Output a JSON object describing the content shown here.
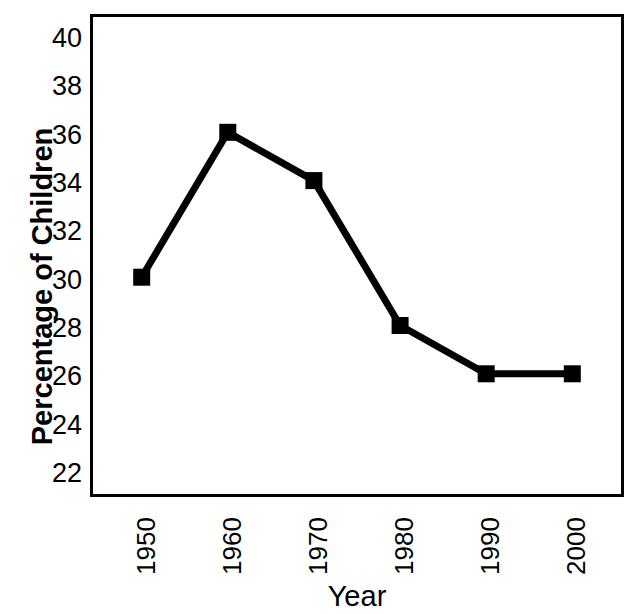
{
  "chart_data": {
    "type": "line",
    "title": "",
    "xlabel": "Year",
    "ylabel": "Percentage of Children",
    "categories": [
      "1950",
      "1960",
      "1970",
      "1980",
      "1990",
      "2000"
    ],
    "x": [
      1950,
      1960,
      1970,
      1980,
      1990,
      2000
    ],
    "values": [
      30.1,
      36.1,
      34.1,
      28.1,
      26.1,
      26.1
    ],
    "series": [
      {
        "name": "Percentage of Children",
        "values": [
          30.1,
          36.1,
          34.1,
          28.1,
          26.1,
          26.1
        ]
      }
    ],
    "ylim": [
      21,
      41
    ],
    "xlim": [
      1944,
      2006
    ],
    "yticks": [
      22,
      24,
      26,
      28,
      30,
      32,
      34,
      36,
      38,
      40
    ],
    "ytick_labels": [
      "22",
      "24",
      "26",
      "28",
      "30",
      "32",
      "34",
      "36",
      "38",
      "40"
    ],
    "xtick_labels": [
      "1950",
      "1960",
      "1970",
      "1980",
      "1990",
      "2000"
    ],
    "grid": false,
    "legend": false,
    "legend_position": "none",
    "marker": "square",
    "line_color": "#000000",
    "marker_color": "#000000",
    "background_color": "#ffffff",
    "frame": true,
    "xtick_rotation": 90
  },
  "axes": {
    "y_title": "Percentage of Children",
    "x_title": "Year"
  },
  "colors": {
    "foreground": "#000000",
    "background": "#ffffff"
  }
}
